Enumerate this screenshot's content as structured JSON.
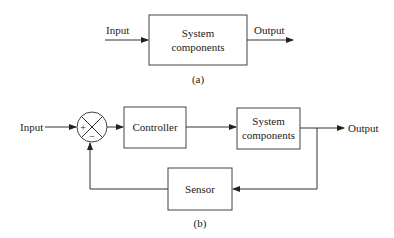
{
  "diagram_a": {
    "input_label": "Input",
    "output_label": "Output",
    "block": {
      "line1": "System",
      "line2": "components"
    },
    "caption": "(a)"
  },
  "diagram_b": {
    "input_label": "Input",
    "output_label": "Output",
    "summing_junction": {
      "plus": "+",
      "minus": "−"
    },
    "controller": {
      "label": "Controller"
    },
    "system": {
      "line1": "System",
      "line2": "components"
    },
    "sensor": {
      "label": "Sensor"
    },
    "caption": "(b)"
  }
}
